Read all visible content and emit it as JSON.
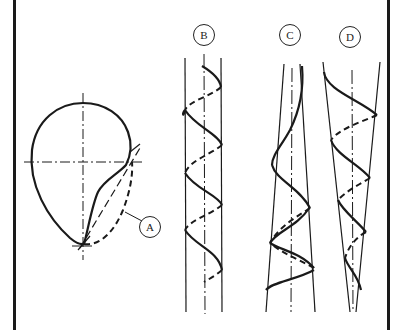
{
  "figure": {
    "labels": {
      "A": "A",
      "B": "B",
      "C": "C",
      "D": "D"
    },
    "description": {
      "A": "Cross-section profile with dashed secondary lobe",
      "B": "Helix on cylinder (constant diameter)",
      "C": "Helix on cone (narrowing upward)",
      "D": "Helix on cone (narrowing downward)"
    },
    "colors": {
      "line": "#1a1a1a",
      "background": "#ffffff"
    }
  }
}
